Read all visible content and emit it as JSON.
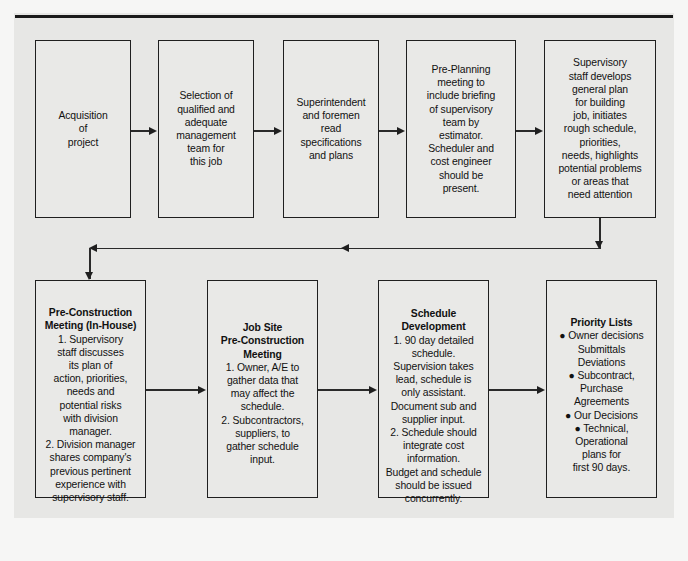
{
  "diagram": {
    "background_color": "#e7e7e5",
    "box_fill_color": "#e9e9e7",
    "line_color": "#1f1f1f",
    "top_row": [
      {
        "id": "acquisition-of-project",
        "heading": "",
        "text": "Acquisition\nof\nproject"
      },
      {
        "id": "selection-of-management-team",
        "heading": "",
        "text": "Selection of\nqualified and\nadequate\nmanagement\nteam for\nthis job"
      },
      {
        "id": "superintendent-reads-specs",
        "heading": "",
        "text": "Superintendent\nand foremen\nread\nspecifications\nand plans"
      },
      {
        "id": "pre-planning-meeting",
        "heading": "",
        "text": "Pre-Planning\nmeeting to\ninclude briefing\nof supervisory\nteam by\nestimator.\nScheduler and\ncost engineer\nshould be\npresent."
      },
      {
        "id": "supervisory-staff-general-plan",
        "heading": "",
        "text": "Supervisory\nstaff develops\ngeneral plan\nfor building\njob, initiates\nrough schedule,\npriorities,\nneeds, highlights\npotential problems\nor areas that\nneed attention"
      }
    ],
    "bottom_row": [
      {
        "id": "pre-construction-meeting-in-house",
        "heading": "Pre-Construction\nMeeting (In-House)",
        "text": "1. Supervisory\nstaff discusses\nits plan of\naction, priorities,\nneeds and\npotential risks\nwith division\nmanager.\n2. Division manager\nshares company's\nprevious pertinent\nexperience with\nsupervisory staff."
      },
      {
        "id": "job-site-pre-construction-meeting",
        "heading": "Job Site\nPre-Construction\nMeeting",
        "text": "1. Owner, A/E to\ngather data that\nmay affect the\nschedule.\n2. Subcontractors,\nsuppliers, to\ngather schedule\ninput."
      },
      {
        "id": "schedule-development",
        "heading": "Schedule\nDevelopment",
        "text": "1. 90 day detailed\nschedule.\nSupervision takes\nlead, schedule is\nonly assistant.\nDocument sub and\nsupplier input.\n2. Schedule should\nintegrate cost\ninformation.\nBudget and schedule\nshould be issued\nconcurrently."
      },
      {
        "id": "priority-lists",
        "heading": "Priority Lists",
        "text": "● Owner decisions\nSubmittals\nDeviations\n● Subcontract,\nPurchase\nAgreements\n● Our Decisions\n● Technical,\nOperational\nplans for\nfirst 90 days."
      }
    ],
    "connectors": [
      {
        "id": "arrow-t1-t2",
        "direction": "right"
      },
      {
        "id": "arrow-t2-t3",
        "direction": "right"
      },
      {
        "id": "arrow-t3-t4",
        "direction": "right"
      },
      {
        "id": "arrow-t4-t5",
        "direction": "right"
      },
      {
        "id": "feedback-t5-to-b1",
        "direction": "down-left-down"
      },
      {
        "id": "arrow-b1-b2",
        "direction": "right"
      },
      {
        "id": "arrow-b2-b3",
        "direction": "right"
      },
      {
        "id": "arrow-b3-b4",
        "direction": "right"
      }
    ]
  }
}
